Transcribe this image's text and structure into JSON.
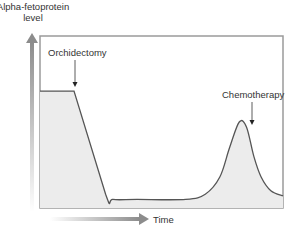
{
  "chart_data": {
    "type": "area",
    "title": "",
    "ylabel": "Alpha-fetoprotein level",
    "ylabel_lines": [
      "Alpha-fetoprotein",
      "level"
    ],
    "xlabel": "Time",
    "grid": false,
    "legend": "none",
    "xlim": [
      0,
      100
    ],
    "ylim": [
      0,
      100
    ],
    "series": [
      {
        "name": "Alpha-fetoprotein level",
        "x": [
          0,
          14,
          27,
          30,
          40,
          60,
          68,
          74,
          78,
          82,
          85,
          88,
          91,
          95,
          100
        ],
        "y": [
          68,
          68,
          8,
          5,
          5,
          5,
          8,
          18,
          35,
          50,
          47,
          30,
          18,
          10,
          7
        ]
      }
    ],
    "annotations": [
      {
        "text": "Orchidectomy",
        "x": 14,
        "y": 68
      },
      {
        "text": "Chemotherapy",
        "x": 88,
        "y": 48
      }
    ],
    "colors": {
      "fill": "#ececec",
      "line": "#555555",
      "frame": "#9a9a9a",
      "axis_arrow": "#8c8c8c"
    }
  }
}
